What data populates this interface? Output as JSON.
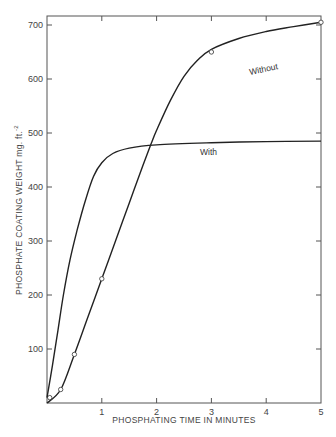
{
  "chart_data": {
    "type": "line",
    "title": "",
    "xlabel": "PHOSPHATING TIME IN MINUTES",
    "ylabel": "PHOSPHATE COATING WEIGHT mg. ft.",
    "ylabel_superscript": "-2",
    "xlim": [
      0,
      5
    ],
    "ylim": [
      0,
      720
    ],
    "x_ticks": [
      1,
      2,
      3,
      4,
      5
    ],
    "y_ticks": [
      100,
      200,
      300,
      400,
      500,
      600,
      700
    ],
    "grid": false,
    "legend": "inline labels on curves",
    "series": [
      {
        "name": "Without",
        "label_position": {
          "x": 3.5,
          "y": 670
        },
        "markers": "open-circle",
        "points": [
          {
            "x": 0.05,
            "y": 10
          },
          {
            "x": 0.25,
            "y": 25
          },
          {
            "x": 0.5,
            "y": 90
          },
          {
            "x": 1.0,
            "y": 230
          },
          {
            "x": 3.0,
            "y": 650
          },
          {
            "x": 5.0,
            "y": 705
          }
        ],
        "curve": [
          [
            0,
            0
          ],
          [
            0.25,
            25
          ],
          [
            0.5,
            90
          ],
          [
            0.75,
            160
          ],
          [
            1.0,
            230
          ],
          [
            1.25,
            300
          ],
          [
            1.5,
            370
          ],
          [
            1.75,
            440
          ],
          [
            1.9,
            480
          ],
          [
            2.0,
            505
          ],
          [
            2.25,
            560
          ],
          [
            2.5,
            605
          ],
          [
            2.75,
            635
          ],
          [
            3.0,
            655
          ],
          [
            3.5,
            675
          ],
          [
            4.0,
            688
          ],
          [
            4.5,
            697
          ],
          [
            5.0,
            705
          ]
        ]
      },
      {
        "name": "With",
        "label_position": {
          "x": 3.0,
          "y": 460
        },
        "markers": "none",
        "curve": [
          [
            0,
            10
          ],
          [
            0.1,
            70
          ],
          [
            0.2,
            135
          ],
          [
            0.3,
            200
          ],
          [
            0.42,
            265
          ],
          [
            0.55,
            320
          ],
          [
            0.7,
            375
          ],
          [
            0.85,
            420
          ],
          [
            1.0,
            445
          ],
          [
            1.2,
            462
          ],
          [
            1.5,
            472
          ],
          [
            2.0,
            478
          ],
          [
            3.0,
            482
          ],
          [
            4.0,
            484
          ],
          [
            5.0,
            485
          ]
        ]
      }
    ]
  },
  "labels": {
    "without": "Without",
    "with": "With"
  }
}
